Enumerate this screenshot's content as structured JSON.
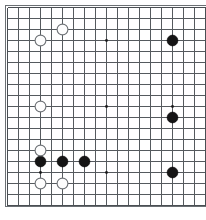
{
  "app": {
    "title": "Go Board Diagram",
    "description": "19x19 Go board position diagram"
  },
  "board": {
    "name": "go-board",
    "size": 19,
    "width_px": 206,
    "height_px": 220,
    "origin_x_px": 7,
    "origin_y_px": 7,
    "cell_px": 11,
    "background_color": "#ffffff",
    "line_color": "#555a5e",
    "border_color": "#6a6f73",
    "black_color": "#151515",
    "white_color": "#fdfdfd",
    "white_outline_color": "#6e7276",
    "stone_radius_px": 5.4,
    "hoshi_radius_px": 1.4,
    "coordinate_labels_visible": false
  },
  "chart_data": {
    "type": "scatter",
    "xlabel": "",
    "ylabel": "",
    "xlim": [
      1,
      19
    ],
    "ylim": [
      1,
      19
    ],
    "grid": true,
    "legend": false,
    "categories": [
      "black",
      "white"
    ],
    "star_points": [
      {
        "col": 4,
        "row": 4
      },
      {
        "col": 10,
        "row": 4
      },
      {
        "col": 16,
        "row": 4
      },
      {
        "col": 4,
        "row": 10
      },
      {
        "col": 10,
        "row": 10
      },
      {
        "col": 16,
        "row": 10
      },
      {
        "col": 4,
        "row": 16
      },
      {
        "col": 10,
        "row": 16
      },
      {
        "col": 16,
        "row": 16
      }
    ],
    "series": [
      {
        "name": "black",
        "color": "#151515",
        "count": 6,
        "stones": [
          {
            "col": 16,
            "row": 4
          },
          {
            "col": 16,
            "row": 11
          },
          {
            "col": 4,
            "row": 15
          },
          {
            "col": 6,
            "row": 15
          },
          {
            "col": 8,
            "row": 15
          },
          {
            "col": 16,
            "row": 16
          }
        ]
      },
      {
        "name": "white",
        "color": "#fdfdfd",
        "count": 6,
        "stones": [
          {
            "col": 6,
            "row": 3
          },
          {
            "col": 4,
            "row": 4
          },
          {
            "col": 4,
            "row": 10
          },
          {
            "col": 4,
            "row": 14
          },
          {
            "col": 4,
            "row": 17
          },
          {
            "col": 6,
            "row": 17
          }
        ]
      }
    ]
  }
}
